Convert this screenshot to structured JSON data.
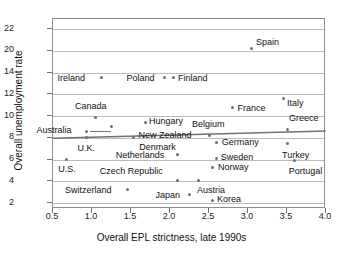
{
  "chart_data": {
    "type": "scatter",
    "title": "",
    "xlabel": "Overall EPL strictness, late 1990s",
    "ylabel": "Overall unemployment rate",
    "xlim": [
      0.5,
      4.0
    ],
    "xticks": [
      "0.5",
      "1.0",
      "1.5",
      "2.0",
      "2.5",
      "3.0",
      "3.5",
      "4.0"
    ],
    "yticks": [
      "2",
      "4",
      "6",
      "8",
      "10",
      "12",
      "14",
      "20",
      "22"
    ],
    "ylim": [
      2,
      22
    ],
    "grid": true,
    "legend": "none",
    "note": "y-axis is broken between 14 and 20; ticks are evenly spaced",
    "points": [
      {
        "label": "U.S.",
        "x": 0.67,
        "y": 6.05,
        "label_dx": -8,
        "label_dy": 10
      },
      {
        "label": "Ireland",
        "x": 1.12,
        "y": 13.5,
        "label_dx": -44,
        "label_dy": 1
      },
      {
        "label": "Australia",
        "x": 0.93,
        "y": 8.6,
        "label_dx": -50,
        "label_dy": -1
      },
      {
        "label": "U.K.",
        "x": 0.93,
        "y": 8.05,
        "label_dx": -9,
        "label_dy": 11
      },
      {
        "label": "Canada",
        "x": 1.05,
        "y": 9.9,
        "label_dx": -21,
        "label_dy": -11
      },
      {
        "label": "New Zealand",
        "x": 1.25,
        "y": 9.0,
        "label_dx": 27,
        "label_dy": 9
      },
      {
        "label": "Switzerland",
        "x": 1.45,
        "y": 3.25,
        "label_dx": -62,
        "label_dy": 1
      },
      {
        "label": "Denmark",
        "x": 1.53,
        "y": 8.05,
        "label_dx": 6,
        "label_dy": 10
      },
      {
        "label": "Hungary",
        "x": 1.68,
        "y": 9.4,
        "label_dx": 4,
        "label_dy": -1
      },
      {
        "label": "Poland",
        "x": 1.93,
        "y": 13.5,
        "label_dx": -38,
        "label_dy": 1
      },
      {
        "label": "Finland",
        "x": 2.05,
        "y": 13.5,
        "label_dx": 4,
        "label_dy": 1
      },
      {
        "label": "Netherlands",
        "x": 2.1,
        "y": 6.5,
        "label_dx": -62,
        "label_dy": 1
      },
      {
        "label": "Czech Republic",
        "x": 2.1,
        "y": 4.05,
        "label_dx": -78,
        "label_dy": -9
      },
      {
        "label": "Japan",
        "x": 2.25,
        "y": 2.75,
        "label_dx": -34,
        "label_dy": 1
      },
      {
        "label": "Austria",
        "x": 2.37,
        "y": 4.1,
        "label_dx": -2,
        "label_dy": 10
      },
      {
        "label": "Belgium",
        "x": 2.5,
        "y": 8.2,
        "label_dx": -17,
        "label_dy": -11
      },
      {
        "label": "Korea",
        "x": 2.55,
        "y": 2.25,
        "label_dx": 4,
        "label_dy": -1
      },
      {
        "label": "Sweden",
        "x": 2.6,
        "y": 6.1,
        "label_dx": 4,
        "label_dy": -1
      },
      {
        "label": "Germany",
        "x": 2.6,
        "y": 7.6,
        "label_dx": 5,
        "label_dy": 0
      },
      {
        "label": "Norway",
        "x": 2.55,
        "y": 5.3,
        "label_dx": 5,
        "label_dy": 0
      },
      {
        "label": "France",
        "x": 2.8,
        "y": 10.8,
        "label_dx": 5,
        "label_dy": 1
      },
      {
        "label": "Spain",
        "x": 3.05,
        "y": 20.2,
        "label_dx": 4,
        "label_dy": -6
      },
      {
        "label": "Italy",
        "x": 3.45,
        "y": 11.6,
        "label_dx": 4,
        "label_dy": 5
      },
      {
        "label": "Greece",
        "x": 3.5,
        "y": 8.8,
        "label_dx": 2,
        "label_dy": -11
      },
      {
        "label": "Turkey",
        "x": 3.5,
        "y": 7.5,
        "label_dx": -5,
        "label_dy": 12
      },
      {
        "label": "Portugal",
        "x": 3.6,
        "y": 5.95,
        "label_dx": -6,
        "label_dy": 11
      }
    ],
    "trendline": {
      "x_start": 0.5,
      "y_start": 7.95,
      "x_end": 4.0,
      "y_end": 8.62,
      "color": "#6f7173"
    },
    "leader_lines": [
      {
        "x1": 0.98,
        "y1": 8.6,
        "x2": 1.24,
        "y2": 8.6
      }
    ]
  },
  "colors": {
    "point": "#6b6e70",
    "grid": "#b9bcbe",
    "frame": "#8d8f91",
    "text": "#111111",
    "background": "#ffffff"
  }
}
